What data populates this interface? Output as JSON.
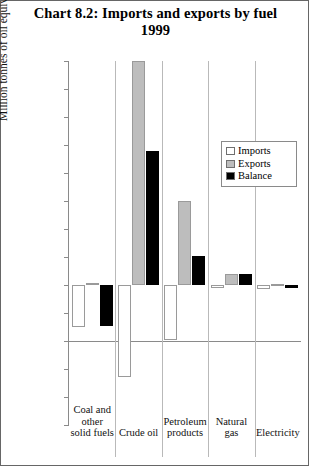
{
  "chart_data": {
    "type": "bar",
    "title": "Chart 8.2: Imports and exports by fuel 1999",
    "title_line1": "Chart 8.2: Imports and exports by fuel",
    "title_line2": "1999",
    "xlabel": "",
    "ylabel": "Million tonnes of oil equivalent",
    "ylim": [
      -50,
      80
    ],
    "ytick_step": 10,
    "yticks": [
      "80",
      "70",
      "60",
      "50",
      "40",
      "30",
      "20",
      "10",
      "0",
      "-10",
      "-20",
      "-30",
      "-40",
      "-50"
    ],
    "grid": false,
    "legend_position": "upper right",
    "categories": [
      "Coal and other solid fuels",
      "Crude oil",
      "Petroleum products",
      "Natural gas",
      "Electricity"
    ],
    "category_lines": [
      [
        "Coal and",
        "other",
        "solid fuels"
      ],
      [
        "Crude oil"
      ],
      [
        "Petroleum",
        "products"
      ],
      [
        "Natural",
        "gas"
      ],
      [
        "Electricity"
      ]
    ],
    "series": [
      {
        "name": "Imports",
        "color": "#ffffff",
        "values": [
          -15.0,
          -33.0,
          -19.5,
          -1.0,
          -1.5
        ]
      },
      {
        "name": "Exports",
        "color": "#bdbdbd",
        "values": [
          0.7,
          80.0,
          30.0,
          4.0,
          0.3
        ]
      },
      {
        "name": "Balance",
        "color": "#000000",
        "values": [
          -14.5,
          48.0,
          10.5,
          4.0,
          -1.0
        ]
      }
    ]
  },
  "legend": {
    "items": [
      {
        "label": "Imports",
        "color": "#ffffff"
      },
      {
        "label": "Exports",
        "color": "#bdbdbd"
      },
      {
        "label": "Balance",
        "color": "#000000"
      }
    ]
  }
}
